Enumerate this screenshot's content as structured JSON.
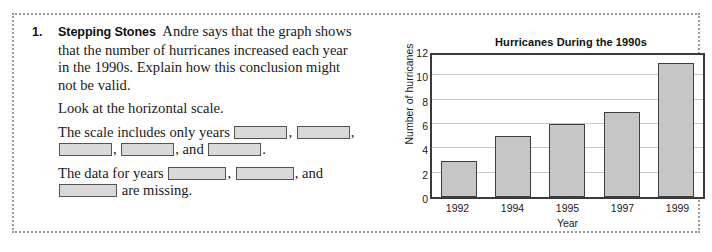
{
  "exercise": {
    "number": "1.",
    "label": "Stepping Stones",
    "prompt": "Andre says that the graph shows that the number of hurricanes increased each year in the 1990s. Explain how this conclusion might not be valid.",
    "hint": "Look at the horizontal scale.",
    "fill_in_1_prefix": "The scale includes only years",
    "fill_in_1_comma": ",",
    "fill_in_1_and": ", and",
    "fill_in_1_period": ".",
    "fill_in_2_prefix": "The data for years",
    "fill_in_2_and": ", and",
    "fill_in_2_suffix": "are missing.",
    "blank_value": ""
  },
  "chart_data": {
    "type": "bar",
    "title": "Hurricanes During the 1990s",
    "xlabel": "Year",
    "ylabel": "Number of hurricanes",
    "categories": [
      "1992",
      "1994",
      "1995",
      "1997",
      "1999"
    ],
    "values": [
      3,
      5,
      6,
      7,
      11
    ],
    "ylim": [
      0,
      12
    ],
    "yticks": [
      "0",
      "2",
      "4",
      "6",
      "8",
      "10",
      "12"
    ],
    "ytick_values": [
      0,
      2,
      4,
      6,
      8,
      10,
      12
    ],
    "grid": true,
    "legend": "none",
    "bar_fill_color": "#c6c6c6",
    "bar_border_color": "#3f3f3f",
    "gridline_color": "#c9c9c9",
    "axis_color": "#3a3a3a"
  }
}
